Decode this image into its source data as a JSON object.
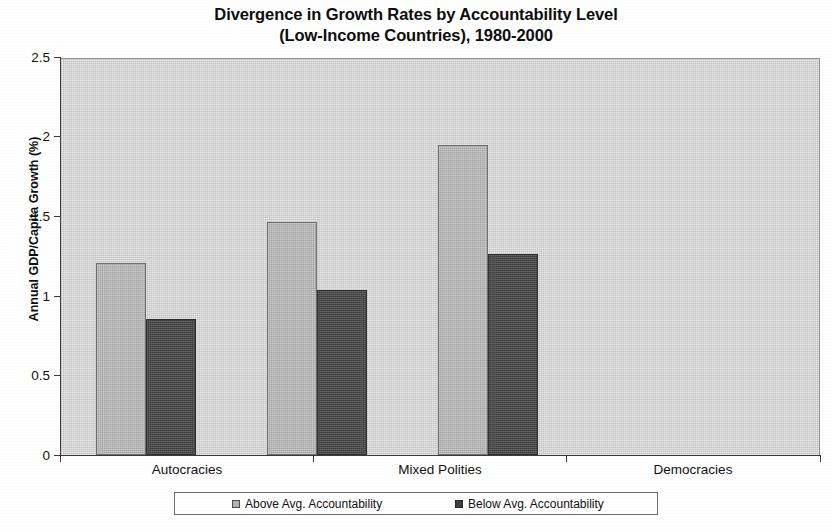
{
  "chart_data": {
    "type": "bar",
    "title": "Divergence in Growth Rates by Accountability Level (Low-Income Countries), 1980-2000",
    "title_lines": [
      "Divergence in Growth Rates by Accountability Level",
      "(Low-Income Countries), 1980-2000"
    ],
    "categories": [
      "Autocracies",
      "Mixed Polities",
      "Democracies"
    ],
    "series": [
      {
        "name": "Above Avg. Accountability",
        "values": [
          1.21,
          1.47,
          1.96
        ],
        "color": "#b1b1b1"
      },
      {
        "name": "Below Avg. Accountability",
        "values": [
          0.86,
          1.04,
          1.27
        ],
        "color": "#4a4a4a"
      }
    ],
    "xlabel": "",
    "ylabel": "Annual GDP/Capita Growth (%)",
    "ylim": [
      0,
      2.5
    ],
    "ytick_labels": [
      "0",
      "0.5",
      "1",
      "1.5",
      "2",
      "2.5"
    ],
    "ytick_values": [
      0,
      0.5,
      1,
      1.5,
      2,
      2.5
    ],
    "grid": false,
    "legend_position": "bottom",
    "plot_background_color": "#c8c8c8"
  }
}
